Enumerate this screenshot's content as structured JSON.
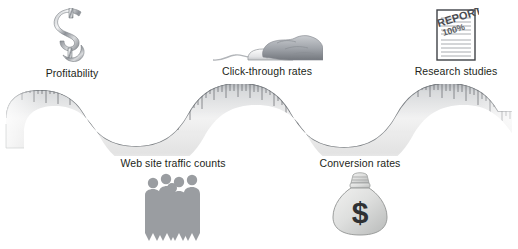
{
  "figure": {
    "type": "conceptual-diagram",
    "background_color": "#ffffff",
    "label_color": "#231f20",
    "ribbon": {
      "name": "measuring-tape-ribbon",
      "description": "wavy measuring tape with tick marks",
      "tick_color": "#6b6f76",
      "body_color": "#e8e8e8",
      "edge_color": "#54585f",
      "crest_count": 3,
      "trough_count": 2
    },
    "nodes": [
      {
        "id": "profitability",
        "label": "Profitability",
        "icon": "dollar-sign-icon",
        "position": "above",
        "x": 72,
        "y": 8
      },
      {
        "id": "click-through-rates",
        "label": "Click-through rates",
        "icon": "hand-on-mouse-icon",
        "position": "above",
        "x": 267,
        "y": 31
      },
      {
        "id": "research-studies",
        "label": "Research studies",
        "icon": "report-document-icon",
        "position": "above",
        "x": 456,
        "y": 8
      },
      {
        "id": "web-site-traffic-counts",
        "label": "Web site traffic counts",
        "icon": "people-group-icon",
        "position": "below",
        "x": 173,
        "y": 157
      },
      {
        "id": "conversion-rates",
        "label": "Conversion rates",
        "icon": "money-bag-icon",
        "position": "below",
        "x": 360,
        "y": 157
      }
    ],
    "report_icon_text": {
      "stamp_title": "REPORT",
      "stamp_value": "100%"
    },
    "money_bag_icon_text": {
      "symbol": "$"
    }
  }
}
